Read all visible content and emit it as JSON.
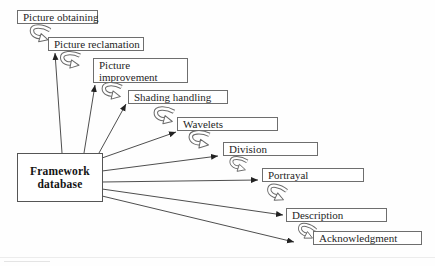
{
  "diagram_type": "cascade-flow-diagram",
  "colors": {
    "background": "#ffffff",
    "line_ink": "#3a3a3a",
    "box_border": "#6e6e6e",
    "text_ink": "#1f1f1f"
  },
  "hub": {
    "line1": "Framework",
    "line2": "database"
  },
  "stages": [
    {
      "label": "Picture obtaining"
    },
    {
      "label": "Picture reclamation"
    },
    {
      "label": "Picture improvement"
    },
    {
      "label": "Shading handling"
    },
    {
      "label": "Wavelets"
    },
    {
      "label": "Division"
    },
    {
      "label": "Portrayal"
    },
    {
      "label": "Description"
    },
    {
      "label": "Acknowledgment"
    }
  ]
}
